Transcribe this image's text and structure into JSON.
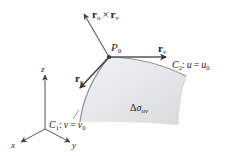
{
  "diagram": {
    "point_label": {
      "main": "P",
      "sub": "0"
    },
    "normal_vector": {
      "a": "r",
      "a_sub": "u",
      "op": "×",
      "b": "r",
      "b_sub": "v"
    },
    "ru_vector": {
      "main": "r",
      "sub": "u"
    },
    "rv_vector": {
      "main": "r",
      "sub": "v"
    },
    "curve_c2": {
      "name": "C",
      "name_sub": "2",
      "colon": ":",
      "var": "u",
      "eq": "=",
      "val": "u",
      "val_sub": "0"
    },
    "curve_c1": {
      "name": "C",
      "name_sub": "1",
      "colon": ":",
      "var": "v",
      "eq": "=",
      "val": "v",
      "val_sub": "0"
    },
    "area_element": {
      "delta": "Δ",
      "sigma": "σ",
      "sub": "uv"
    },
    "axes": {
      "x": "x",
      "y": "y",
      "z": "z"
    },
    "colors": {
      "surface_fill": "#e3e4e6",
      "surface_edge": "#9a9ea3",
      "vector": "#555555",
      "ink": "#222222"
    }
  }
}
